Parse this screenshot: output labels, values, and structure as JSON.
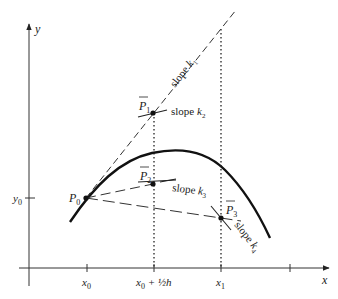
{
  "diagram": {
    "axes": {
      "x_label": "x",
      "y_label": "y",
      "x_ticks": [
        {
          "label_main": "x",
          "label_sub": "0",
          "label_rest": ""
        },
        {
          "label_main": "x",
          "label_sub": "0",
          "label_rest": " + ½h"
        },
        {
          "label_main": "x",
          "label_sub": "1",
          "label_rest": ""
        }
      ],
      "y_ticks": [
        {
          "label_main": "y",
          "label_sub": "0"
        }
      ]
    },
    "points": {
      "p0": {
        "main": "P",
        "sub": "0"
      },
      "p1": {
        "main": "P",
        "sub": "1",
        "bar": true
      },
      "p2": {
        "main": "P",
        "sub": "2",
        "bar": true
      },
      "p3": {
        "main": "P",
        "sub": "3",
        "bar": true
      }
    },
    "slopes": {
      "k1": {
        "text": "slope ",
        "k": "k",
        "sub": "1"
      },
      "k2": {
        "text": "slope ",
        "k": "k",
        "sub": "2"
      },
      "k3": {
        "text": "slope ",
        "k": "k",
        "sub": "3"
      },
      "k4": {
        "text": "slope ",
        "k": "k",
        "sub": "4"
      }
    },
    "colors": {
      "ink": "#222222",
      "background": "#ffffff"
    }
  }
}
